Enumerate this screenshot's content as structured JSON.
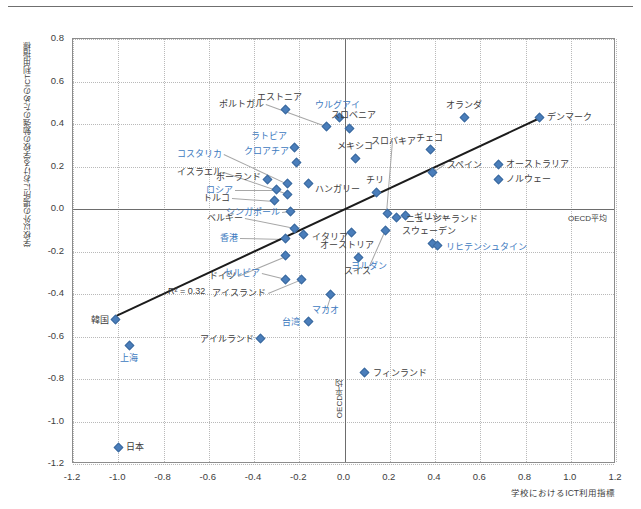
{
  "chart_data": {
    "type": "scatter",
    "title": "",
    "xlabel": "学校におけるICT利用指標",
    "ylabel": "学校以外の場所における学校の勉強のためのICT利用指標",
    "xlim": [
      -1.2,
      1.2
    ],
    "ylim": [
      -1.2,
      0.8
    ],
    "xticks": [
      "-1.2",
      "-1.0",
      "-0.8",
      "-0.6",
      "-0.4",
      "-0.2",
      "0.0",
      "0.2",
      "0.4",
      "0.6",
      "0.8",
      "1.0",
      "1.2"
    ],
    "yticks": [
      "0.8",
      "0.6",
      "0.4",
      "0.2",
      "0.0",
      "-0.2",
      "-0.4",
      "-0.6",
      "-0.8",
      "-1.0",
      "-1.2"
    ],
    "grid": true,
    "legend": "none",
    "marker_color": "#4a7ebb",
    "highlight_label_color": "#3d7ac0",
    "annotations": {
      "r2": "R² = 0.32",
      "oecd_mean_horizontal": "OECD平均",
      "oecd_mean_vertical": "OECD平均"
    },
    "trendline": {
      "visible": true,
      "color": "#1c1c1c",
      "x_start": -1.01,
      "y_start": -0.5,
      "x_end": 0.86,
      "y_end": 0.43
    },
    "points": [
      {
        "label": "エストニア",
        "x": -0.26,
        "y": 0.47,
        "highlight": false,
        "label_pos": "above"
      },
      {
        "label": "ポルトガル",
        "x": -0.08,
        "y": 0.39,
        "highlight": false,
        "label_pos": "leader-left"
      },
      {
        "label": "ウルグアイ",
        "x": -0.02,
        "y": 0.43,
        "highlight": true,
        "label_pos": "above"
      },
      {
        "label": "スロベニア",
        "x": 0.02,
        "y": 0.38,
        "highlight": false,
        "label_pos": "above"
      },
      {
        "label": "ラトビア",
        "x": -0.22,
        "y": 0.29,
        "highlight": true,
        "label_pos": "left"
      },
      {
        "label": "クロアチア",
        "x": -0.21,
        "y": 0.22,
        "highlight": true,
        "label_pos": "left"
      },
      {
        "label": "メキシコ",
        "x": 0.05,
        "y": 0.24,
        "highlight": false,
        "label_pos": "above"
      },
      {
        "label": "コスタリカ",
        "x": -0.25,
        "y": 0.12,
        "highlight": true,
        "label_pos": "leader-left"
      },
      {
        "label": "イスラエル",
        "x": -0.25,
        "y": 0.07,
        "highlight": false,
        "label_pos": "leader-left"
      },
      {
        "label": "ハンガリー",
        "x": -0.16,
        "y": 0.12,
        "highlight": false,
        "label_pos": "left"
      },
      {
        "label": "チリ",
        "x": 0.14,
        "y": 0.08,
        "highlight": false,
        "label_pos": "above"
      },
      {
        "label": "ポーランド",
        "x": -0.34,
        "y": 0.14,
        "highlight": false,
        "label_pos": "left"
      },
      {
        "label": "ロシア",
        "x": -0.3,
        "y": 0.09,
        "highlight": true,
        "label_pos": "leader-left"
      },
      {
        "label": "トルコ",
        "x": -0.31,
        "y": 0.04,
        "highlight": false,
        "label_pos": "leader-left"
      },
      {
        "label": "シンガポール",
        "x": -0.24,
        "y": -0.01,
        "highlight": true,
        "label_pos": "leader-left"
      },
      {
        "label": "スロバキア",
        "x": 0.19,
        "y": -0.02,
        "highlight": false,
        "label_pos": "leader-up"
      },
      {
        "label": "オランダ",
        "x": 0.53,
        "y": 0.43,
        "highlight": false,
        "label_pos": "above"
      },
      {
        "label": "デンマーク",
        "x": 0.86,
        "y": 0.43,
        "highlight": false,
        "label_pos": "right"
      },
      {
        "label": "チェコ",
        "x": 0.38,
        "y": 0.28,
        "highlight": false,
        "label_pos": "above"
      },
      {
        "label": "オーストラリア",
        "x": 0.68,
        "y": 0.21,
        "highlight": false,
        "label_pos": "right"
      },
      {
        "label": "ノルウェー",
        "x": 0.68,
        "y": 0.14,
        "highlight": false,
        "label_pos": "right"
      },
      {
        "label": "スペイン",
        "x": 0.39,
        "y": 0.17,
        "highlight": false,
        "label_pos": "above"
      },
      {
        "label": "ニュージーランド",
        "x": 0.23,
        "y": -0.04,
        "highlight": false,
        "label_pos": "right"
      },
      {
        "label": "ギリシャ",
        "x": 0.27,
        "y": -0.03,
        "highlight": false,
        "label_pos": "right"
      },
      {
        "label": "ベルギー",
        "x": -0.22,
        "y": -0.09,
        "highlight": false,
        "label_pos": "leader-left"
      },
      {
        "label": "香港",
        "x": -0.26,
        "y": -0.14,
        "highlight": true,
        "label_pos": "leader-left"
      },
      {
        "label": "イタリア",
        "x": -0.18,
        "y": -0.12,
        "highlight": false,
        "label_pos": "right"
      },
      {
        "label": "オーストリア",
        "x": 0.03,
        "y": -0.11,
        "highlight": false,
        "label_pos": "above"
      },
      {
        "label": "ヨルダン",
        "x": 0.18,
        "y": -0.1,
        "highlight": true,
        "label_pos": "leader-down"
      },
      {
        "label": "スウェーデン",
        "x": 0.39,
        "y": -0.16,
        "highlight": false,
        "label_pos": "above"
      },
      {
        "label": "リヒテンシュタイン",
        "x": 0.41,
        "y": -0.17,
        "highlight": true,
        "label_pos": "right"
      },
      {
        "label": "スイス",
        "x": 0.06,
        "y": -0.23,
        "highlight": false,
        "label_pos": "below"
      },
      {
        "label": "セルビア",
        "x": -0.26,
        "y": -0.33,
        "highlight": true,
        "label_pos": "leader-left"
      },
      {
        "label": "ドイツ",
        "x": -0.26,
        "y": -0.22,
        "highlight": false,
        "label_pos": "leader-left"
      },
      {
        "label": "アイスランド",
        "x": -0.19,
        "y": -0.33,
        "highlight": false,
        "label_pos": "leader-left"
      },
      {
        "label": "マカオ",
        "x": -0.06,
        "y": -0.4,
        "highlight": true,
        "label_pos": "leader-left"
      },
      {
        "label": "韓国",
        "x": -1.01,
        "y": -0.52,
        "highlight": false,
        "label_pos": "left"
      },
      {
        "label": "台湾",
        "x": -0.16,
        "y": -0.53,
        "highlight": true,
        "label_pos": "left"
      },
      {
        "label": "アイルランド",
        "x": -0.37,
        "y": -0.61,
        "highlight": false,
        "label_pos": "left"
      },
      {
        "label": "上海",
        "x": -0.95,
        "y": -0.64,
        "highlight": true,
        "label_pos": "below"
      },
      {
        "label": "フィンランド",
        "x": 0.09,
        "y": -0.77,
        "highlight": false,
        "label_pos": "right"
      },
      {
        "label": "日本",
        "x": -1.0,
        "y": -1.12,
        "highlight": false,
        "label_pos": "right"
      }
    ]
  }
}
